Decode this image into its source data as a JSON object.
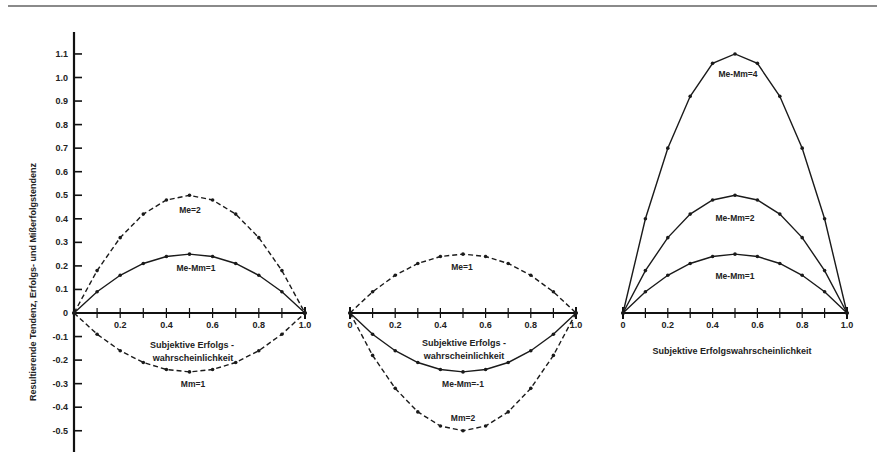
{
  "chart_data": {
    "type": "line",
    "ylabel": "Resultierende Tendenz, Erfolgs- und Mißerfolgstendenz",
    "yticks": [
      1.1,
      1.0,
      0.9,
      0.8,
      0.7,
      0.6,
      0.5,
      0.4,
      0.3,
      0.2,
      0.1,
      0,
      -0.1,
      -0.2,
      -0.3,
      -0.4,
      -0.5
    ],
    "ytick_labels": [
      "1.1",
      "1.0",
      "0.9",
      "0.8",
      "0.7",
      "0.6",
      "0.5",
      "0.4",
      "0.3",
      "0.2",
      "0.1",
      "0",
      "-0.1",
      "-0.2",
      "-0.3",
      "-0.4",
      "-0.5"
    ],
    "ylim": [
      -0.55,
      1.15
    ],
    "x": [
      0,
      0.1,
      0.2,
      0.3,
      0.4,
      0.5,
      0.6,
      0.7,
      0.8,
      0.9,
      1.0
    ],
    "panels": [
      {
        "xlabel_line1": "Subjektive Erfolgs -",
        "xlabel_line2": "wahrscheinlichkeit",
        "xtick_labels": [
          "0.2",
          "0.4",
          "0.6",
          "0.8",
          "1.0"
        ],
        "series": [
          {
            "name": "Me=2",
            "style": "dashed",
            "values": [
              0,
              0.18,
              0.32,
              0.42,
              0.48,
              0.5,
              0.48,
              0.42,
              0.32,
              0.18,
              0
            ]
          },
          {
            "name": "Me-Mm=1",
            "style": "solid",
            "values": [
              0,
              0.09,
              0.16,
              0.21,
              0.24,
              0.25,
              0.24,
              0.21,
              0.16,
              0.09,
              0
            ]
          },
          {
            "name": "Mm=1",
            "style": "dashed",
            "values": [
              0,
              -0.09,
              -0.16,
              -0.21,
              -0.24,
              -0.25,
              -0.24,
              -0.21,
              -0.16,
              -0.09,
              0
            ]
          }
        ]
      },
      {
        "xlabel_line1": "Subjektive Erfolgs -",
        "xlabel_line2": "wahrscheinlichkeit",
        "xtick_labels": [
          "0",
          "0.2",
          "0.4",
          "0.6",
          "0.8",
          "1.0"
        ],
        "series": [
          {
            "name": "Me=1",
            "style": "dashed",
            "values": [
              0,
              0.09,
              0.16,
              0.21,
              0.24,
              0.25,
              0.24,
              0.21,
              0.16,
              0.09,
              0
            ]
          },
          {
            "name": "Me-Mm=-1",
            "style": "solid",
            "values": [
              0,
              -0.09,
              -0.16,
              -0.21,
              -0.24,
              -0.25,
              -0.24,
              -0.21,
              -0.16,
              -0.09,
              0
            ]
          },
          {
            "name": "Mm=2",
            "style": "dashed",
            "values": [
              0,
              -0.18,
              -0.32,
              -0.42,
              -0.48,
              -0.5,
              -0.48,
              -0.42,
              -0.32,
              -0.18,
              0
            ]
          }
        ]
      },
      {
        "xlabel_line1": "Subjektive Erfolgswahrscheinlichkeit",
        "xlabel_line2": "",
        "xtick_labels": [
          "0",
          "0.2",
          "0.4",
          "0.6",
          "0.8",
          "1.0"
        ],
        "series": [
          {
            "name": "Me-Mm=4",
            "style": "solid",
            "values": [
              0,
              0.4,
              0.7,
              0.92,
              1.06,
              1.1,
              1.06,
              0.92,
              0.7,
              0.4,
              0
            ]
          },
          {
            "name": "Me-Mm=2",
            "style": "solid",
            "values": [
              0,
              0.18,
              0.32,
              0.42,
              0.48,
              0.5,
              0.48,
              0.42,
              0.32,
              0.18,
              0
            ]
          },
          {
            "name": "Me-Mm=1",
            "style": "solid",
            "values": [
              0,
              0.09,
              0.16,
              0.21,
              0.24,
              0.25,
              0.24,
              0.21,
              0.16,
              0.09,
              0
            ]
          }
        ]
      }
    ]
  },
  "labels": {
    "ylabel": "Resultierende Tendenz, Erfolgs- und Mißerfolgstendenz",
    "p1_me2": "Me=2",
    "p1_memm1": "Me-Mm=1",
    "p1_mm1": "Mm=1",
    "p1_xlabel1": "Subjektive Erfolgs -",
    "p1_xlabel2": "wahrscheinlichkeit",
    "p2_me1": "Me=1",
    "p2_memm_neg1": "Me-Mm=-1",
    "p2_mm2": "Mm=2",
    "p2_xlabel1": "Subjektive Erfolgs -",
    "p2_xlabel2": "wahrscheinlichkeit",
    "p3_memm4": "Me-Mm=4",
    "p3_memm2": "Me-Mm=2",
    "p3_memm1": "Me-Mm=1",
    "p3_xlabel": "Subjektive Erfolgswahrscheinlichkeit"
  }
}
